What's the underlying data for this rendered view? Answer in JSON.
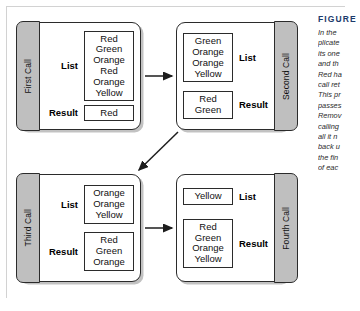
{
  "figure": {
    "title": "FIGURE",
    "caption_lines": [
      "In the",
      "plicate",
      "its one",
      "and th",
      "Red ha",
      "call ret",
      "This pr",
      "passes",
      "Remov",
      "calling",
      "all it n",
      "back u",
      "the fin",
      "of eac"
    ]
  },
  "labels": {
    "list": "List",
    "result": "Result"
  },
  "colors": {
    "tab_fill": "#bfbfbf",
    "frame_border": "#2b2b2b",
    "caption_heading": "#1b3a6b",
    "page_background": "#ffffff"
  },
  "calls": [
    {
      "id": "first-call",
      "tab_label": "First Call",
      "tab_side": "left",
      "list": [
        "Red",
        "Green",
        "Orange",
        "Red",
        "Orange",
        "Yellow"
      ],
      "result": [
        "Red"
      ]
    },
    {
      "id": "second-call",
      "tab_label": "Second Call",
      "tab_side": "right",
      "list": [
        "Green",
        "Orange",
        "Orange",
        "Yellow"
      ],
      "result": [
        "Red",
        "Green"
      ]
    },
    {
      "id": "third-call",
      "tab_label": "Third Call",
      "tab_side": "left",
      "list": [
        "Orange",
        "Orange",
        "Yellow"
      ],
      "result": [
        "Red",
        "Green",
        "Orange"
      ]
    },
    {
      "id": "fourth-call",
      "tab_label": "Fourth Call",
      "tab_side": "right",
      "list": [
        "Yellow"
      ],
      "result": [
        "Red",
        "Green",
        "Orange",
        "Yellow"
      ]
    }
  ],
  "arrows": [
    {
      "name": "first-to-second",
      "from": "first-call",
      "to": "second-call",
      "direction": "right"
    },
    {
      "name": "second-to-third",
      "from": "second-call",
      "to": "third-call",
      "direction": "down-left"
    },
    {
      "name": "third-to-fourth",
      "from": "third-call",
      "to": "fourth-call",
      "direction": "right"
    }
  ]
}
